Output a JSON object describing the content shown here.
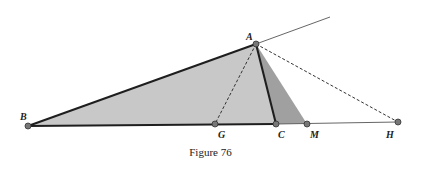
{
  "figure": {
    "caption": "Figure 76",
    "points": {
      "A": {
        "label": "A",
        "x": 256,
        "y": 44
      },
      "B": {
        "label": "B",
        "x": 28,
        "y": 126
      },
      "G": {
        "label": "G",
        "x": 215,
        "y": 124
      },
      "C": {
        "label": "C",
        "x": 276,
        "y": 124
      },
      "M": {
        "label": "M",
        "x": 307,
        "y": 124
      },
      "H": {
        "label": "H",
        "x": 398,
        "y": 122
      }
    },
    "ray_end": {
      "x": 330,
      "y": 17
    },
    "colors": {
      "light_fill": "#c8c8c8",
      "dark_fill": "#a0a0a0",
      "stroke": "#1e1e1e",
      "point": "#777777"
    }
  }
}
